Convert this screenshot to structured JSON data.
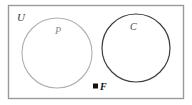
{
  "diagram": {
    "type": "venn-diagram",
    "title": "",
    "universe": {
      "label": "U",
      "name": "universal-set",
      "border_color": "#9a9a9a",
      "fill_color": "#ffffff"
    },
    "sets": [
      {
        "id": "P",
        "label": "P",
        "name": "set-p",
        "stroke_color": "#b0b0b0",
        "label_color": "#8a8a8a",
        "cx": 57,
        "cy": 53,
        "r": 35
      },
      {
        "id": "C",
        "label": "C",
        "name": "set-c",
        "stroke_color": "#3c3c3c",
        "label_color": "#4a4a4a",
        "cx": 136,
        "cy": 48,
        "r": 34
      }
    ],
    "points": [
      {
        "id": "F",
        "label": "F",
        "name": "point-f",
        "marker": "filled-square",
        "marker_color": "#111111",
        "x": 96,
        "y": 87,
        "region": "outside-both-sets"
      }
    ],
    "relationship": "disjoint"
  }
}
